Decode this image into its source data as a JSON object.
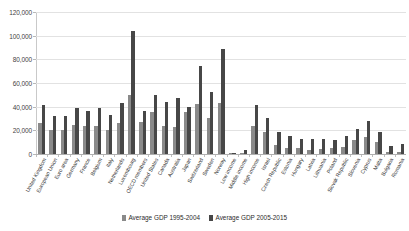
{
  "chart_data": {
    "type": "bar",
    "title": "",
    "xlabel": "",
    "ylabel": "",
    "ylim": [
      0,
      120000
    ],
    "yticks": [
      0,
      20000,
      40000,
      60000,
      80000,
      100000,
      120000
    ],
    "ytick_labels": [
      "0",
      "20,000",
      "40,000",
      "60,000",
      "80,000",
      "100,000",
      "120,000"
    ],
    "grid": true,
    "legend_position": "bottom",
    "colors": {
      "series_1995_2004": "#8a8a8a",
      "series_2005_2015": "#474747",
      "gridline": "#e2e2e2",
      "axis": "#b0b0b0",
      "text": "#2e2e2e",
      "background": "#ffffff"
    },
    "categories": [
      "United Kingdom",
      "European Union",
      "Euro area",
      "Germany",
      "France",
      "Belgium",
      "Italy",
      "Netherlands",
      "Luxembourg",
      "OECD members",
      "United States",
      "Canada",
      "Australia",
      "Japan",
      "Switzerland",
      "Sweden",
      "Norway",
      "Low income",
      "Middle income",
      "High income",
      "Israel",
      "Czech Republic",
      "Estonia",
      "Hungary",
      "Latvia",
      "Lithuania",
      "Poland",
      "Slovak Republic",
      "Slovenia",
      "Cyprus",
      "Malta",
      "Bulgaria",
      "Romania"
    ],
    "series": [
      {
        "name": "Average GDP 1995-2004",
        "values": [
          26000,
          20500,
          20000,
          24500,
          23500,
          23500,
          20500,
          26500,
          49500,
          27000,
          35500,
          24000,
          23000,
          35500,
          42000,
          30500,
          43500,
          330,
          1250,
          23500,
          18500,
          7200,
          5200,
          5000,
          3700,
          3900,
          5100,
          5600,
          11500,
          14500,
          10500,
          1800,
          2100
        ]
      },
      {
        "name": "Average GDP 2005-2015",
        "values": [
          41500,
          32500,
          32000,
          38500,
          36500,
          38500,
          33000,
          43500,
          104000,
          36500,
          49500,
          44000,
          47000,
          39500,
          74500,
          52000,
          89000,
          620,
          3800,
          41000,
          30500,
          18500,
          15500,
          12500,
          12500,
          12500,
          11500,
          15500,
          21500,
          27500,
          19000,
          6500,
          8200
        ]
      }
    ]
  },
  "legend": {
    "items": [
      {
        "label": "Average GDP 1995-2004"
      },
      {
        "label": "Average GDP 2005-2015"
      }
    ]
  }
}
